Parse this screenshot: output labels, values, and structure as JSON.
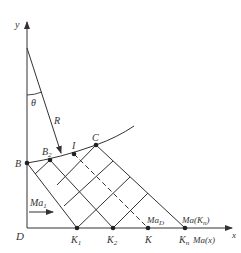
{
  "diagram": {
    "type": "characteristic-mesh-nozzle",
    "colors": {
      "line": "#333333",
      "background": "#ffffff"
    },
    "axes": {
      "x_label": "x",
      "y_label": "y",
      "origin_label": "D"
    },
    "angle_label": "θ",
    "radius_label": "R",
    "points": {
      "B": {
        "label": "B",
        "sub": ""
      },
      "B2": {
        "label": "B",
        "sub": "2"
      },
      "I": {
        "label": "I",
        "sub": ""
      },
      "C": {
        "label": "C",
        "sub": ""
      },
      "K1": {
        "label": "K",
        "sub": "1"
      },
      "K2": {
        "label": "K",
        "sub": "2"
      },
      "K": {
        "label": "K",
        "sub": ""
      },
      "Kn": {
        "label": "K",
        "sub": "n"
      }
    },
    "annotations": {
      "inflow": {
        "label": "Ma",
        "sub": "1"
      },
      "mad": {
        "label": "Ma",
        "sub": "D"
      },
      "ma_kn": {
        "label": "Ma(K",
        "sub": "n",
        "suffix": ")"
      },
      "ma_x": "Ma(x)"
    }
  }
}
